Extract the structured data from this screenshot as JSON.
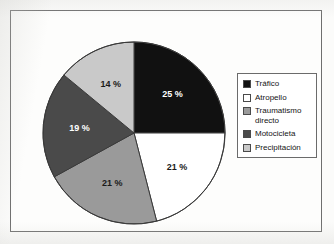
{
  "chart_data": {
    "type": "pie",
    "title": "",
    "subtitle": "",
    "xlabel": "",
    "ylabel": "",
    "legend_position": "right",
    "grid": false,
    "unit": "%",
    "start_angle_deg": 0,
    "direction": "clockwise",
    "categories": [
      "Tráfico",
      "Atropello",
      "Traumatismo directo",
      "Motocicleta",
      "Precipitación"
    ],
    "values": [
      25,
      21,
      21,
      19,
      14
    ],
    "labels": [
      "25 %",
      "21 %",
      "21 %",
      "19 %",
      "14 %"
    ],
    "colors": [
      "#111111",
      "#ffffff",
      "#9a9a9a",
      "#4a4a4a",
      "#c9c9c9"
    ],
    "label_text_colors": [
      "#ffffff",
      "#1a1a1a",
      "#1a1a1a",
      "#ffffff",
      "#1a1a1a"
    ],
    "slices": [
      {
        "name": "Tráfico",
        "value": 25,
        "label": "25 %",
        "color": "#111111",
        "label_color": "on-dark"
      },
      {
        "name": "Atropello",
        "value": 21,
        "label": "21 %",
        "color": "#ffffff",
        "label_color": "on-light"
      },
      {
        "name": "Traumatismo directo",
        "value": 21,
        "label": "21 %",
        "color": "#9a9a9a",
        "label_color": "on-light"
      },
      {
        "name": "Motocicleta",
        "value": 19,
        "label": "19 %",
        "color": "#4a4a4a",
        "label_color": "on-dark"
      },
      {
        "name": "Precipitación",
        "value": 14,
        "label": "14 %",
        "color": "#c9c9c9",
        "label_color": "on-light"
      }
    ]
  },
  "legend": {
    "items": [
      {
        "label": "Tráfico",
        "color": "#111111"
      },
      {
        "label": "Atropello",
        "color": "#ffffff"
      },
      {
        "label": "Traumatismo\ndirecto",
        "color": "#9a9a9a"
      },
      {
        "label": "Motocicleta",
        "color": "#4a4a4a"
      },
      {
        "label": "Precipitación",
        "color": "#c9c9c9"
      }
    ]
  },
  "style": {
    "page_background": "#fbfbfa",
    "frame_border": "#6e6e6e",
    "pie_outline": "#3a3a3a",
    "legend_border": "#6b6b6b"
  }
}
